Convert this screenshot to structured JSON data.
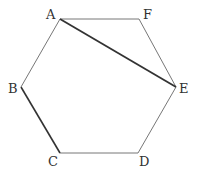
{
  "diagram": {
    "type": "regular-hexagon",
    "vertices": [
      {
        "name": "A",
        "x": 60,
        "y": 19,
        "lx": 46,
        "ly": 19
      },
      {
        "name": "F",
        "x": 139,
        "y": 19,
        "lx": 143,
        "ly": 19
      },
      {
        "name": "E",
        "x": 176,
        "y": 87,
        "lx": 179,
        "ly": 93
      },
      {
        "name": "D",
        "x": 138,
        "y": 153,
        "lx": 139,
        "ly": 166
      },
      {
        "name": "C",
        "x": 60,
        "y": 153,
        "lx": 48,
        "ly": 166
      },
      {
        "name": "B",
        "x": 21,
        "y": 87,
        "lx": 8,
        "ly": 93
      }
    ],
    "edges": [
      {
        "from": "A",
        "to": "F",
        "style": "thin"
      },
      {
        "from": "F",
        "to": "E",
        "style": "thin"
      },
      {
        "from": "E",
        "to": "D",
        "style": "thin"
      },
      {
        "from": "D",
        "to": "C",
        "style": "thin"
      },
      {
        "from": "C",
        "to": "B",
        "style": "bold"
      },
      {
        "from": "B",
        "to": "A",
        "style": "thin"
      },
      {
        "from": "A",
        "to": "E",
        "style": "bold"
      }
    ],
    "colors": {
      "thin": "#777777",
      "bold": "#333333"
    }
  }
}
